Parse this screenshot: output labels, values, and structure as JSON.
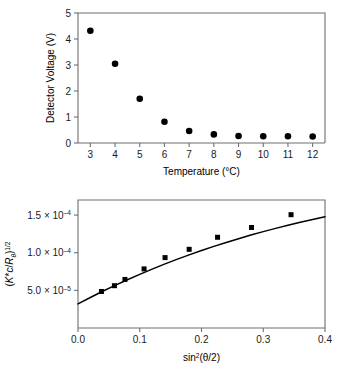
{
  "figure": {
    "background_color": "#ffffff",
    "axis_color": "#6e6e6e",
    "marker_color": "#000000"
  },
  "chart_data": [
    {
      "id": "detector-voltage-vs-temperature",
      "type": "scatter",
      "title": "",
      "xlabel": "Temperature (°C)",
      "ylabel": "Detector Voltage (V)",
      "xlim": [
        2.5,
        12.5
      ],
      "ylim": [
        0,
        5
      ],
      "xticks": [
        3,
        4,
        5,
        6,
        7,
        8,
        9,
        10,
        11,
        12
      ],
      "xticklabels": [
        "3",
        "4",
        "5",
        "6",
        "7",
        "8",
        "9",
        "10",
        "11",
        "12"
      ],
      "yticks": [
        0,
        1,
        2,
        3,
        4,
        5
      ],
      "yticklabels": [
        "0",
        "1",
        "2",
        "3",
        "4",
        "5"
      ],
      "grid": false,
      "legend": false,
      "marker": "filled-circle",
      "x": [
        3,
        4,
        5,
        6,
        7,
        8,
        9,
        10,
        11,
        12
      ],
      "y": [
        4.32,
        3.05,
        1.7,
        0.82,
        0.46,
        0.33,
        0.27,
        0.26,
        0.26,
        0.25
      ]
    },
    {
      "id": "zimm-plot-kc-over-rtheta",
      "type": "scatter",
      "title": "",
      "xlabel": "sin²(θ/2)",
      "ylabel": "(K*c/Rθ)^1/2",
      "ylabel_parts": {
        "open": "(",
        "k": "K",
        "star": "*",
        "c": "c",
        "slash": "/",
        "r": "R",
        "theta_sub": "θ",
        "close": ")",
        "exponent": "1/2"
      },
      "xlabel_parts": {
        "sin": "sin",
        "power": "2",
        "arg": "(θ/2)"
      },
      "xlim": [
        0.0,
        0.4
      ],
      "ylim": [
        0.0,
        0.00017
      ],
      "xticks": [
        0.0,
        0.1,
        0.2,
        0.3,
        0.4
      ],
      "xticklabels": [
        "0.0",
        "0.1",
        "0.2",
        "0.3",
        "0.4"
      ],
      "yticks": [
        5e-05,
        0.0001,
        0.00015
      ],
      "yticklabels": [
        "5.0 × 10–5",
        "1.0 × 10–4",
        "1.5 × 10–4"
      ],
      "yticklabel_parts": [
        {
          "mantissa": "5.0",
          "times": "×",
          "base": "10",
          "exponent": "–5"
        },
        {
          "mantissa": "1.0",
          "times": "×",
          "base": "10",
          "exponent": "–4"
        },
        {
          "mantissa": "1.5",
          "times": "×",
          "base": "10",
          "exponent": "–4"
        }
      ],
      "grid": false,
      "legend": false,
      "marker": "filled-square",
      "x": [
        0.038,
        0.059,
        0.076,
        0.107,
        0.141,
        0.18,
        0.226,
        0.281,
        0.345
      ],
      "y": [
        4.85e-05,
        5.62e-05,
        6.45e-05,
        7.85e-05,
        9.35e-05,
        0.0001045,
        0.0001205,
        0.0001335,
        0.0001505
      ],
      "fit_curve": {
        "description": "smooth concave fit through data",
        "x": [
          0.0,
          0.02,
          0.04,
          0.06,
          0.08,
          0.1,
          0.12,
          0.14,
          0.16,
          0.18,
          0.2,
          0.22,
          0.24,
          0.26,
          0.28,
          0.3,
          0.32,
          0.34,
          0.36,
          0.38,
          0.4
        ],
        "y": [
          3.2e-05,
          4.05e-05,
          4.88e-05,
          5.66e-05,
          6.41e-05,
          7.13e-05,
          7.82e-05,
          8.48e-05,
          9.11e-05,
          9.71e-05,
          0.0001029,
          0.0001084,
          0.0001136,
          0.0001186,
          0.0001234,
          0.000128,
          0.0001323,
          0.0001364,
          0.0001404,
          0.0001441,
          0.0001477
        ]
      }
    }
  ]
}
